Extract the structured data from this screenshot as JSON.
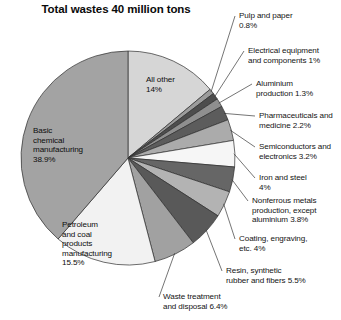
{
  "chart_data": {
    "type": "pie",
    "title": "Total wastes 40 million tons",
    "xlabel": "",
    "ylabel": "",
    "legend": "none",
    "grid": false,
    "units": "percent of 40 million tons",
    "categories": [
      "All other",
      "Pulp and paper",
      "Electrical equipment and components",
      "Aluminium production",
      "Pharmaceuticals and medicine",
      "Semiconductors and electronics",
      "Iron and steel",
      "Nonferrous metals production, except aluminium",
      "Coating, engraving, etc.",
      "Resin, synthetic rubber and fibers",
      "Waste treatment and disposal",
      "Petroleum and coal products manufacturing",
      "Basic chemical manufacturing"
    ],
    "values": [
      14,
      0.8,
      1,
      1.3,
      2.2,
      3.2,
      4,
      3.8,
      4,
      5.5,
      6.4,
      15.5,
      38.9
    ],
    "value_labels": [
      "14%",
      "0.8%",
      "1%",
      "1.3%",
      "2.2%",
      "3.2%",
      "4%",
      "3.8%",
      "4%",
      "5.5%",
      "6.4%",
      "15.5%",
      "38.9%"
    ],
    "colors": [
      "#d2d2d2",
      "#9a9a9a",
      "#4a4a4a",
      "#8d8d8d",
      "#5a5a5a",
      "#a8a8a8",
      "#f4f4f4",
      "#636363",
      "#b0b0b0",
      "#565656",
      "#9e9e9e",
      "#515151",
      "#f2f2f2",
      "#a0a0a0"
    ],
    "start_angle_deg": 0,
    "direction": "clockwise"
  },
  "chart": {
    "title": "Total wastes 40 million tons",
    "slices": [
      {
        "id": "all-other",
        "label": "All other",
        "pct": "14%",
        "value": 14,
        "fill": "#d6d6d6",
        "label_lines": "All other\n14%",
        "placement": "inside",
        "lx": 146,
        "ly": 75,
        "align": "left"
      },
      {
        "id": "pulp-paper",
        "label": "Pulp and paper",
        "pct": "0.8%",
        "value": 0.8,
        "fill": "#9c9c9c",
        "label_lines": "Pulp and paper\n0.8%",
        "placement": "outside",
        "lx": 239,
        "ly": 11,
        "align": "left"
      },
      {
        "id": "electrical",
        "label": "Electrical equipment and components",
        "pct": "1%",
        "value": 1,
        "fill": "#4d4d4d",
        "label_lines": "Electrical equipment\nand components 1%",
        "placement": "outside",
        "lx": 248,
        "ly": 46,
        "align": "left"
      },
      {
        "id": "aluminium",
        "label": "Aluminium production",
        "pct": "1.3%",
        "value": 1.3,
        "fill": "#8f8f8f",
        "label_lines": "Aluminium\nproduction 1.3%",
        "placement": "outside",
        "lx": 256,
        "ly": 79,
        "align": "left"
      },
      {
        "id": "pharma",
        "label": "Pharmaceuticals and medicine",
        "pct": "2.2%",
        "value": 2.2,
        "fill": "#5c5c5c",
        "label_lines": "Pharmaceuticals and\nmedicine 2.2%",
        "placement": "outside",
        "lx": 259,
        "ly": 111,
        "align": "left"
      },
      {
        "id": "semiconductors",
        "label": "Semiconductors and electronics",
        "pct": "3.2%",
        "value": 3.2,
        "fill": "#ababab",
        "label_lines": "Semiconductors and\nelectronics 3.2%",
        "placement": "outside",
        "lx": 259,
        "ly": 142,
        "align": "left"
      },
      {
        "id": "iron-steel",
        "label": "Iron and steel",
        "pct": "4%",
        "value": 4,
        "fill": "#f6f6f6",
        "label_lines": "Iron and steel\n4%",
        "placement": "outside",
        "lx": 259,
        "ly": 173,
        "align": "left"
      },
      {
        "id": "nonferrous",
        "label": "Nonferrous metals production, except aluminium",
        "pct": "3.8%",
        "value": 3.8,
        "fill": "#666666",
        "label_lines": "Nonferrous metals\nproduction, except\naluminium 3.8%",
        "placement": "outside",
        "lx": 252,
        "ly": 196,
        "align": "left"
      },
      {
        "id": "coating",
        "label": "Coating, engraving, etc.",
        "pct": "4%",
        "value": 4,
        "fill": "#b3b3b3",
        "label_lines": "Coating, engraving,\netc. 4%",
        "placement": "outside",
        "lx": 239,
        "ly": 234,
        "align": "left"
      },
      {
        "id": "resin",
        "label": "Resin, synthetic rubber and fibers",
        "pct": "5.5%",
        "value": 5.5,
        "fill": "#595959",
        "label_lines": "Resin, synthetic\nrubber and fibers 5.5%",
        "placement": "outside",
        "lx": 226,
        "ly": 266,
        "align": "left"
      },
      {
        "id": "waste-treatment",
        "label": "Waste treatment and disposal",
        "pct": "6.4%",
        "value": 6.4,
        "fill": "#a1a1a1",
        "label_lines": "Waste treatment\nand disposal 6.4%",
        "placement": "outside",
        "lx": 163,
        "ly": 292,
        "align": "left"
      },
      {
        "id": "petroleum-coal",
        "label": "Petroleum and coal products manufacturing",
        "pct": "15.5%",
        "value": 15.5,
        "fill": "#f2f2f2",
        "label_lines": "Petroleum\nand coal\nproducts\nmanufacturing\n15.5%",
        "placement": "inside",
        "lx": 62,
        "ly": 220,
        "align": "left"
      },
      {
        "id": "basic-chemical",
        "label": "Basic chemical manufacturing",
        "pct": "38.9%",
        "value": 38.9,
        "fill": "#a3a3a3",
        "label_lines": "Basic\nchemical\nmanufacturing\n38.9%",
        "placement": "inside",
        "lx": 33,
        "ly": 126,
        "align": "left"
      }
    ]
  }
}
